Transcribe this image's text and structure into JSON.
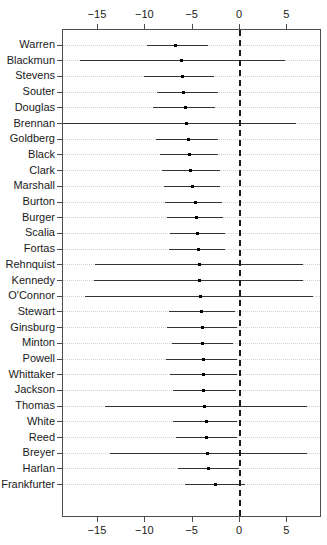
{
  "chart_data": {
    "type": "scatter",
    "title": "",
    "xlabel": "",
    "ylabel": "",
    "xlim": [
      -18.7,
      8.7
    ],
    "ylim": [
      0,
      30
    ],
    "grid": true,
    "legend": null,
    "reference_line": {
      "x": 0,
      "style": "dashed"
    },
    "xticks": [
      -15,
      -10,
      -5,
      0,
      5
    ],
    "xtick_labels": [
      "−15",
      "−10",
      "−5",
      "0",
      "5"
    ],
    "axis_top": true,
    "axis_bottom": true,
    "categories": [
      "Warren",
      "Blackmun",
      "Stevens",
      "Souter",
      "Douglas",
      "Brennan",
      "Goldberg",
      "Black",
      "Clark",
      "Marshall",
      "Burton",
      "Burger",
      "Scalia",
      "Fortas",
      "Rehnquist",
      "Kennedy",
      "O'Connor",
      "Stewart",
      "Ginsburg",
      "Minton",
      "Powell",
      "Whittaker",
      "Jackson",
      "Thomas",
      "White",
      "Reed",
      "Breyer",
      "Harlan",
      "Frankfurter"
    ],
    "points": [
      {
        "label": "Warren",
        "estimate": -6.7,
        "low": -9.7,
        "high": -3.3
      },
      {
        "label": "Blackmun",
        "estimate": -6.1,
        "low": -16.8,
        "high": 4.9
      },
      {
        "label": "Stevens",
        "estimate": -6.0,
        "low": -10.0,
        "high": -2.6
      },
      {
        "label": "Souter",
        "estimate": -5.9,
        "low": -8.7,
        "high": -2.2
      },
      {
        "label": "Douglas",
        "estimate": -5.6,
        "low": -9.1,
        "high": -2.5
      },
      {
        "label": "Brennan",
        "estimate": -5.5,
        "low": -18.7,
        "high": 6.0
      },
      {
        "label": "Goldberg",
        "estimate": -5.3,
        "low": -8.8,
        "high": -2.2
      },
      {
        "label": "Black",
        "estimate": -5.2,
        "low": -8.3,
        "high": -2.2
      },
      {
        "label": "Clark",
        "estimate": -5.1,
        "low": -8.1,
        "high": -2.0
      },
      {
        "label": "Marshall",
        "estimate": -4.9,
        "low": -7.9,
        "high": -2.0
      },
      {
        "label": "Burton",
        "estimate": -4.6,
        "low": -7.8,
        "high": -1.8
      },
      {
        "label": "Burger",
        "estimate": -4.5,
        "low": -7.6,
        "high": -1.7
      },
      {
        "label": "Scalia",
        "estimate": -4.4,
        "low": -7.3,
        "high": -1.5
      },
      {
        "label": "Fortas",
        "estimate": -4.3,
        "low": -7.4,
        "high": -1.5
      },
      {
        "label": "Rehnquist",
        "estimate": -4.2,
        "low": -15.2,
        "high": 6.8
      },
      {
        "label": "Kennedy",
        "estimate": -4.2,
        "low": -15.3,
        "high": 6.8
      },
      {
        "label": "O'Connor",
        "estimate": -4.1,
        "low": -16.3,
        "high": 7.8
      },
      {
        "label": "Stewart",
        "estimate": -4.0,
        "low": -7.4,
        "high": -0.4
      },
      {
        "label": "Ginsburg",
        "estimate": -3.9,
        "low": -7.6,
        "high": -0.2
      },
      {
        "label": "Minton",
        "estimate": -3.9,
        "low": -7.1,
        "high": -0.6
      },
      {
        "label": "Powell",
        "estimate": -3.8,
        "low": -7.7,
        "high": -0.2
      },
      {
        "label": "Whittaker",
        "estimate": -3.7,
        "low": -7.3,
        "high": -0.2
      },
      {
        "label": "Jackson",
        "estimate": -3.7,
        "low": -7.0,
        "high": -0.3
      },
      {
        "label": "Thomas",
        "estimate": -3.6,
        "low": -14.1,
        "high": 7.2
      },
      {
        "label": "White",
        "estimate": -3.4,
        "low": -7.0,
        "high": -0.2
      },
      {
        "label": "Reed",
        "estimate": -3.4,
        "low": -6.6,
        "high": -0.2
      },
      {
        "label": "Breyer",
        "estimate": -3.3,
        "low": -13.6,
        "high": 7.2
      },
      {
        "label": "Harlan",
        "estimate": -3.2,
        "low": -6.4,
        "high": 0.0
      },
      {
        "label": "Frankfurter",
        "estimate": -2.5,
        "low": -5.7,
        "high": 0.6
      }
    ]
  }
}
